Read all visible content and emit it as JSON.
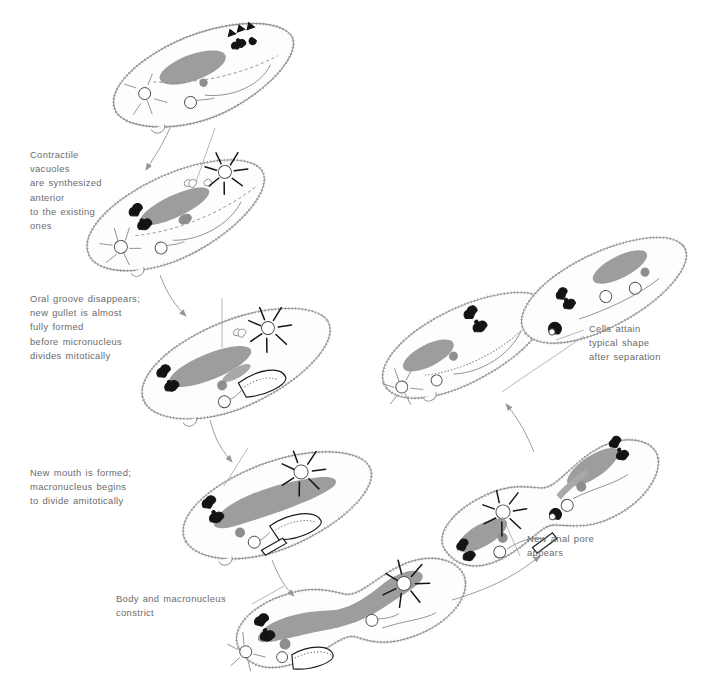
{
  "figure": {
    "background_color": "#ffffff",
    "line_color": "#8d8d8f",
    "macronucleus_color": "#9d9d9f",
    "accent_dark": "#141414",
    "text_color": "#6a6a6c"
  },
  "annotations": [
    {
      "id": "contractile-vacuoles",
      "text": "Contractile\nvacuoles\nare synthesized\nanterior\nto the existing\nones",
      "x": 30,
      "y": 148
    },
    {
      "id": "oral-groove",
      "text": "Oral groove disappears;\nnew gullet is almost\nfully formed\nbefore micronucleus\ndivides mitotically",
      "x": 30,
      "y": 292
    },
    {
      "id": "new-mouth",
      "text": "New mouth is formed;\nmacronucleus begins\nto divide amitotically",
      "x": 30,
      "y": 466
    },
    {
      "id": "body-constrict",
      "text": "Body and macronucleus\nconstrict",
      "x": 116,
      "y": 592
    },
    {
      "id": "new-anal-pore",
      "text": "New anal pore\nappears",
      "x": 527,
      "y": 532
    },
    {
      "id": "cells-attain-shape",
      "text": "Cells attain\ntypical shape\nafter separation",
      "x": 589,
      "y": 322
    }
  ],
  "stages": [
    {
      "id": "stage-1-interphase",
      "name": "Parent cell",
      "order": 1,
      "center_x": 205,
      "center_y": 78
    },
    {
      "id": "stage-2-new-vacuoles",
      "name": "New contractile vacuoles form",
      "order": 2,
      "center_x": 178,
      "center_y": 218
    },
    {
      "id": "stage-3-new-gullet",
      "name": "New gullet forming, micronucleus divides",
      "order": 3,
      "center_x": 238,
      "center_y": 366
    },
    {
      "id": "stage-4-new-mouth",
      "name": "New mouth formed, macronucleus dividing",
      "order": 4,
      "center_x": 278,
      "center_y": 508
    },
    {
      "id": "stage-5-constriction",
      "name": "Body and macronucleus constrict",
      "order": 5,
      "center_x": 352,
      "center_y": 615
    },
    {
      "id": "stage-6-anal-pore",
      "name": "New anal pore appears, cells nearly separate",
      "order": 6,
      "center_x": 552,
      "center_y": 505
    },
    {
      "id": "stage-7-separated",
      "name": "Two daughter cells attain typical shape",
      "order": 7,
      "center_x": 525,
      "center_y": 330
    }
  ],
  "organelles": [
    {
      "name": "macronucleus"
    },
    {
      "name": "micronucleus"
    },
    {
      "name": "contractile-vacuole"
    },
    {
      "name": "radiating-canal"
    },
    {
      "name": "oral-groove"
    },
    {
      "name": "gullet"
    },
    {
      "name": "anal-pore"
    },
    {
      "name": "food-vacuole"
    },
    {
      "name": "cilia"
    }
  ]
}
